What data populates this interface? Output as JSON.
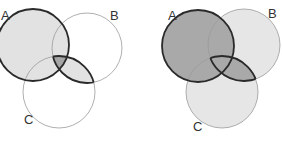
{
  "diagrams": [
    {
      "name": "venn-left",
      "shaded_region": "A ∪ (B ∩ C), A∩B∩C darker",
      "labels": {
        "a": "A",
        "b": "B",
        "c": "C"
      }
    },
    {
      "name": "venn-right",
      "shaded_region": "A ∪ (B ∩ C) dark; B and C light",
      "labels": {
        "a": "A",
        "b": "B",
        "c": "C"
      }
    }
  ],
  "colors": {
    "light": "#e2e2e2",
    "dark": "#a6a6a6",
    "mid": "#bdbdbd",
    "thin_stroke": "#9a9a9a",
    "thick_stroke": "#2a2a2a"
  }
}
